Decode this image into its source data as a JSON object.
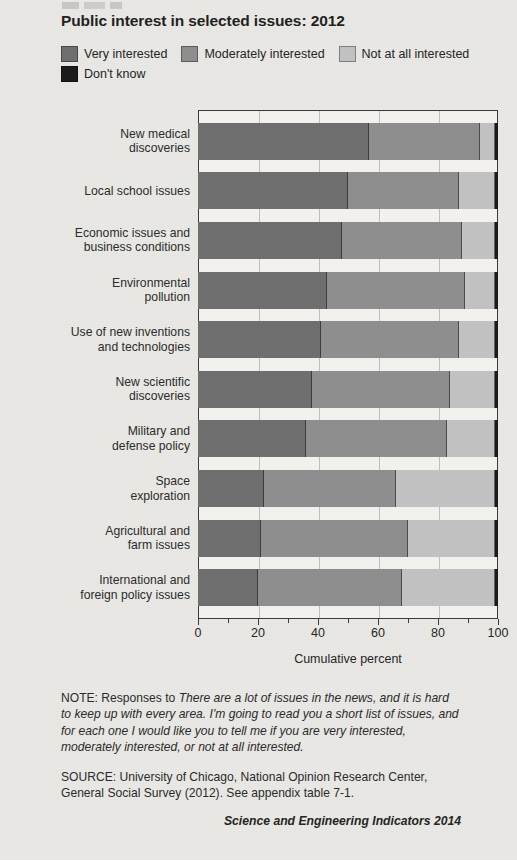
{
  "title": "Public interest in selected issues: 2012",
  "legend": {
    "items": [
      {
        "label": "Very interested",
        "color": "#6e6e6e",
        "icon": "legend-swatch"
      },
      {
        "label": "Moderately interested",
        "color": "#8e8e8e",
        "icon": "legend-swatch"
      },
      {
        "label": "Not at all interested",
        "color": "#c2c2c2",
        "icon": "legend-swatch"
      },
      {
        "label": "Don't know",
        "color": "#1a1a1a",
        "icon": "legend-swatch"
      }
    ]
  },
  "axis": {
    "xlabel": "Cumulative percent",
    "ticks": [
      "0",
      "20",
      "40",
      "60",
      "80",
      "100"
    ]
  },
  "footer": {
    "note_prefix": "NOTE: Responses to ",
    "note_question": "There are a lot of issues in the news, and it is hard to keep up with every area. I'm going to read you a short list of issues, and for each one I would like you to tell me if you are very interested, moderately interested, or not at all interested.",
    "source": "SOURCE: University of Chicago, National Opinion Research Center, General Social Survey (2012). See appendix table 7-1.",
    "credit": "Science and Engineering Indicators 2014"
  },
  "chart_data": {
    "type": "bar",
    "orientation": "horizontal",
    "stacked": true,
    "title": "Public interest in selected issues: 2012",
    "xlabel": "Cumulative percent",
    "ylabel": "",
    "xlim": [
      0,
      100
    ],
    "xticks": [
      0,
      20,
      40,
      60,
      80,
      100
    ],
    "grid": true,
    "legend_position": "top",
    "categories": [
      "New medical discoveries",
      "Local school issues",
      "Economic issues and business conditions",
      "Environmental pollution",
      "Use of new inventions and technologies",
      "New scientific discoveries",
      "Military and defense policy",
      "Space exploration",
      "Agricultural and farm issues",
      "International and foreign policy issues"
    ],
    "category_lines": [
      [
        "New medical",
        "discoveries"
      ],
      [
        "Local school issues"
      ],
      [
        "Economic issues and",
        "business conditions"
      ],
      [
        "Environmental",
        "pollution"
      ],
      [
        "Use of new inventions",
        "and technologies"
      ],
      [
        "New scientific",
        "discoveries"
      ],
      [
        "Military and",
        "defense policy"
      ],
      [
        "Space",
        "exploration"
      ],
      [
        "Agricultural and",
        "farm issues"
      ],
      [
        "International and",
        "foreign policy issues"
      ]
    ],
    "series": [
      {
        "name": "Very interested",
        "color": "#6e6e6e",
        "values": [
          57,
          50,
          48,
          43,
          41,
          38,
          36,
          22,
          21,
          20
        ]
      },
      {
        "name": "Moderately interested",
        "color": "#8e8e8e",
        "values": [
          37,
          37,
          40,
          46,
          46,
          46,
          47,
          44,
          49,
          48
        ]
      },
      {
        "name": "Not at all interested",
        "color": "#c2c2c2",
        "values": [
          5,
          12,
          11,
          10,
          12,
          15,
          16,
          33,
          29,
          31
        ]
      },
      {
        "name": "Don't know",
        "color": "#1a1a1a",
        "values": [
          1,
          1,
          1,
          1,
          1,
          1,
          1,
          1,
          1,
          1
        ]
      }
    ]
  }
}
